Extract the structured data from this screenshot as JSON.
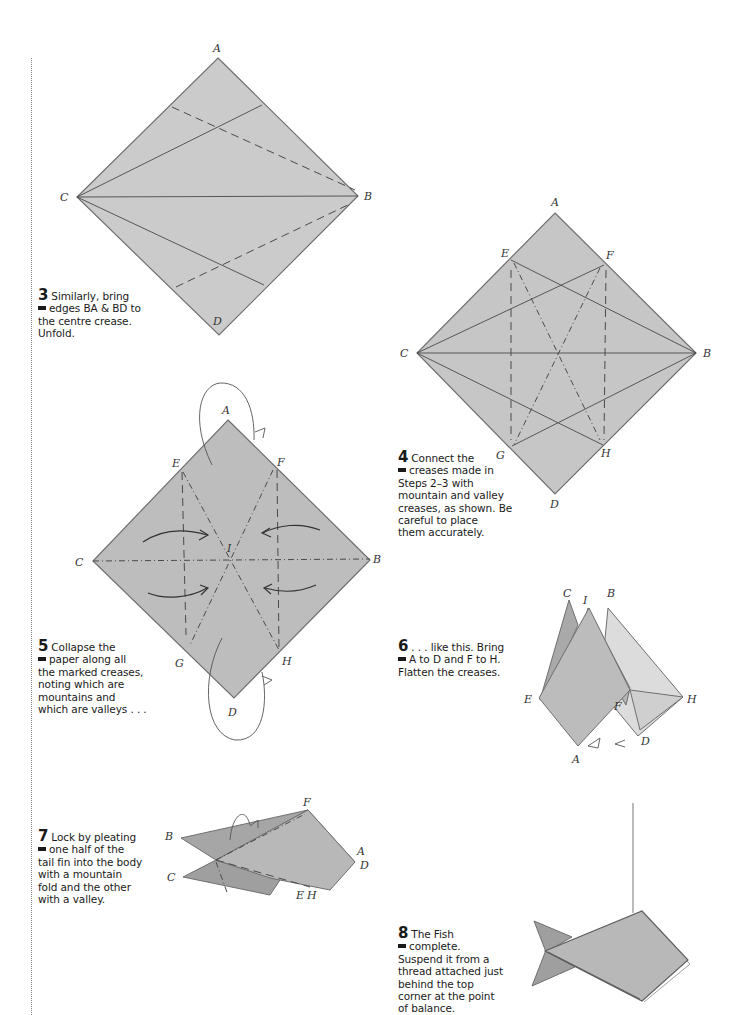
{
  "page": {
    "paper_color": "#c9c9c9",
    "edge_color": "#6f6f6f",
    "line_color": "#4a4a4a"
  },
  "steps": [
    {
      "number": "3",
      "lines": [
        "Similarly, bring",
        "edges BA & BD to",
        "the centre crease.",
        "Unfold."
      ],
      "diagram_labels": [
        "A",
        "B",
        "C",
        "D"
      ]
    },
    {
      "number": "4",
      "lines": [
        "Connect the",
        "creases made in",
        "Steps 2–3 with",
        "mountain and valley",
        "creases, as shown. Be",
        "careful to place",
        "them accurately."
      ],
      "diagram_labels": [
        "A",
        "B",
        "C",
        "D",
        "E",
        "F",
        "G",
        "H"
      ]
    },
    {
      "number": "5",
      "lines": [
        "Collapse the",
        "paper along all",
        "the marked creases,",
        "noting which are",
        "mountains and",
        "which are valleys . . ."
      ],
      "diagram_labels": [
        "A",
        "B",
        "C",
        "D",
        "E",
        "F",
        "G",
        "H",
        "I"
      ]
    },
    {
      "number": "6",
      "lines": [
        ". . . like this. Bring",
        "A to D and F to H.",
        "Flatten the creases."
      ],
      "diagram_labels": [
        "C",
        "I",
        "B",
        "E",
        "F",
        "H",
        "A",
        "D"
      ]
    },
    {
      "number": "7",
      "lines": [
        "Lock by pleating",
        "one half of the",
        "tail fin into the body",
        "with a mountain",
        "fold and the other",
        "with a valley."
      ],
      "diagram_labels": [
        "B",
        "F",
        "A",
        "D",
        "C",
        "E",
        "H"
      ]
    },
    {
      "number": "8",
      "lines": [
        "The Fish",
        "complete.",
        "Suspend it from a",
        "thread attached just",
        "behind the top",
        "corner at the point",
        "of balance."
      ],
      "diagram_labels": []
    }
  ]
}
